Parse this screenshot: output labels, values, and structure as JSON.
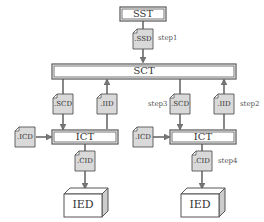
{
  "diagram": {
    "nodes": {
      "sst": "SST",
      "sct": "SCT",
      "ict_left": "ICT",
      "ict_right": "ICT",
      "ied_left": "IED",
      "ied_right": "IED"
    },
    "documents": {
      "ssd": ".SSD",
      "scd_left": ".SCD",
      "iid_left": ".IID",
      "scd_right": ".SCD",
      "iid_right": ".IID",
      "icd_left": ".ICD",
      "icd_right": ".ICD",
      "cid_left": ".CID",
      "cid_right": ".CID"
    },
    "steps": {
      "step1": "step1",
      "step2": "step2",
      "step3": "step3",
      "step4": "step4"
    },
    "colors": {
      "line": "#555555",
      "doc_fill": "#d9d9d9",
      "box_fill": "#ffffff",
      "ied_side": "#cccccc"
    }
  }
}
